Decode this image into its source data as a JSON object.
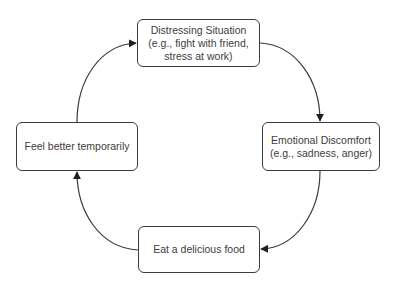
{
  "diagram": {
    "type": "cycle",
    "nodes": [
      {
        "id": "distressing",
        "lines": [
          "Distressing Situation",
          "(e.g., fight with friend,",
          "stress at work)"
        ]
      },
      {
        "id": "discomfort",
        "lines": [
          "Emotional Discomfort",
          "(e.g., sadness, anger)"
        ]
      },
      {
        "id": "eat",
        "lines": [
          "Eat a delicious food"
        ]
      },
      {
        "id": "better",
        "lines": [
          "Feel better temporarily"
        ]
      }
    ],
    "edges": [
      {
        "from": "better",
        "to": "distressing"
      },
      {
        "from": "distressing",
        "to": "discomfort"
      },
      {
        "from": "discomfort",
        "to": "eat"
      },
      {
        "from": "eat",
        "to": "better"
      }
    ],
    "colors": {
      "stroke": "#3a3a3a",
      "text": "#3d3d3d",
      "background": "#ffffff"
    }
  }
}
